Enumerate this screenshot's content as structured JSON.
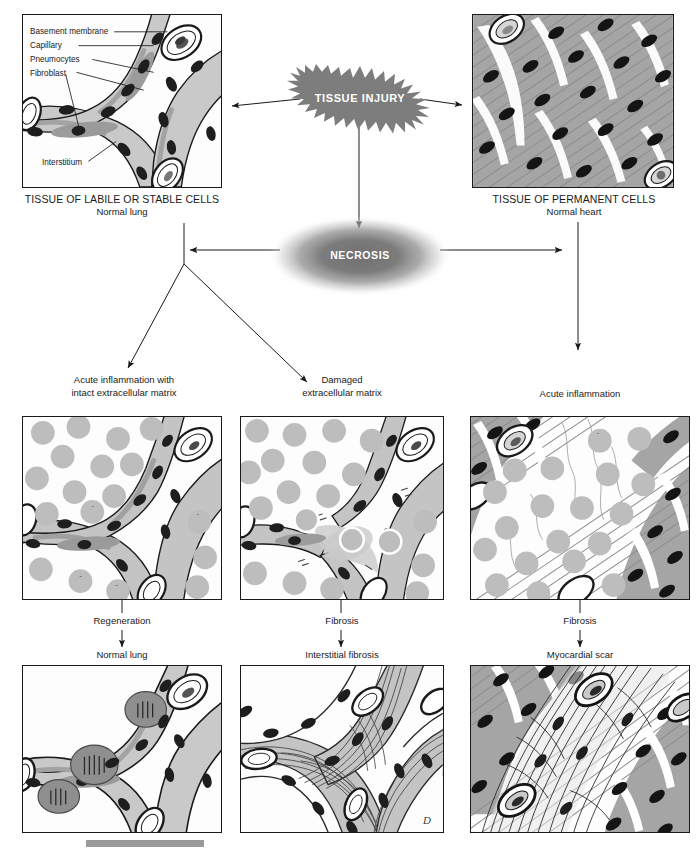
{
  "diagram": {
    "type": "pathology-flowchart",
    "nodes": {
      "tissue_injury": "TISSUE INJURY",
      "necrosis": "NECROSIS"
    },
    "top_panels": [
      {
        "id": "normal-lung",
        "heading": "TISSUE OF LABILE OR STABLE CELLS",
        "subheading": "Normal lung",
        "callouts": [
          "Basement membrane",
          "Capillary",
          "Pneumocytes",
          "Fibroblast",
          "Interstitium"
        ]
      },
      {
        "id": "normal-heart",
        "heading": "TISSUE OF PERMANENT CELLS",
        "subheading": "Normal heart",
        "callouts": []
      }
    ],
    "middle_labels": [
      {
        "id": "acute-intact",
        "line1": "Acute inflammation with",
        "line2": "intact extracellular matrix"
      },
      {
        "id": "damaged-ecm",
        "line1": "Damaged",
        "line2": "extracellular matrix"
      },
      {
        "id": "acute-heart",
        "line1": "Acute inflammation",
        "line2": ""
      }
    ],
    "process_labels": [
      "Regeneration",
      "Fibrosis",
      "Fibrosis"
    ],
    "outcome_labels": [
      "Normal lung",
      "Interstitial fibrosis",
      "Myocardial scar"
    ],
    "artist_mark": "D",
    "colors": {
      "ink": "#1a1a1a",
      "burst_fill": "#7d7d7d",
      "necrosis_fill": "#8a8a8a",
      "tissue_mid": "#a8a8a8",
      "tissue_light": "#cfcfcf",
      "tissue_dark": "#6e6e6e",
      "nucleus": "#1e1e1e",
      "caption_rule": "#9a9a9a"
    }
  }
}
